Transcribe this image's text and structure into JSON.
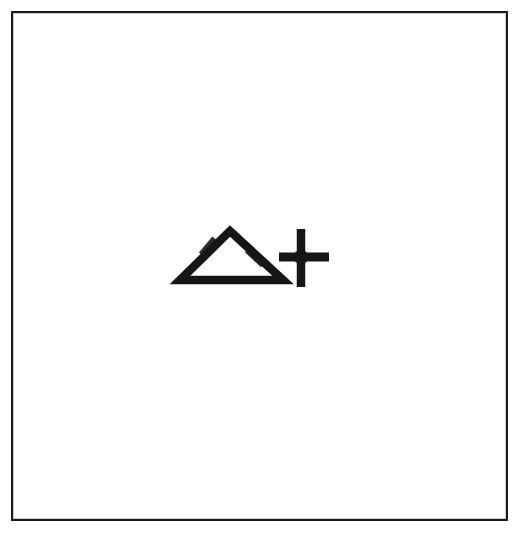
{
  "page": {
    "width": 523,
    "height": 537,
    "background_color": "#ffffff"
  },
  "frame": {
    "name": "border-rectangle",
    "stroke_color": "#1b1b1b",
    "stroke_width_px": 2.5,
    "left": 11,
    "top": 11,
    "width": 497,
    "height": 510
  },
  "figure": {
    "ink_color": "#161616",
    "stroke_width_px": 8,
    "symbols": [
      {
        "id": "triangle",
        "name": "triangle-outline",
        "glyph": "△",
        "label": "triangle",
        "apex_x": 228,
        "apex_y": 229,
        "base_left_x": 178,
        "base_right_x": 281,
        "base_y": 278,
        "filled": false
      },
      {
        "id": "plus",
        "name": "plus-sign",
        "glyph": "+",
        "label": "plus",
        "center_x": 299,
        "center_y": 255,
        "horizontal_left_x": 277,
        "horizontal_right_x": 327,
        "horizontal_y": 255,
        "vertical_top_y": 227,
        "vertical_bottom_y": 285,
        "vertical_x": 299
      }
    ],
    "sequence_reading": "△+"
  }
}
